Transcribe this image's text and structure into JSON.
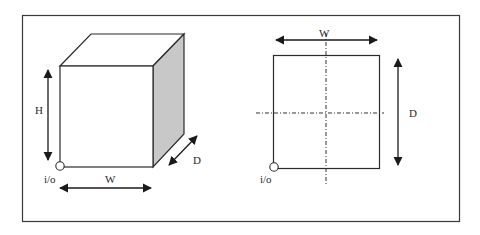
{
  "figure": {
    "frame": {
      "stroke": "#3a3a3a"
    },
    "left_view": {
      "name": "isometric-box",
      "labels": {
        "height": "H",
        "width": "W",
        "depth": "D",
        "io": "i/o"
      },
      "side_fill": "#c8c8c8"
    },
    "right_view": {
      "name": "top-view",
      "labels": {
        "width": "W",
        "depth": "D",
        "io": "i/o"
      }
    }
  }
}
